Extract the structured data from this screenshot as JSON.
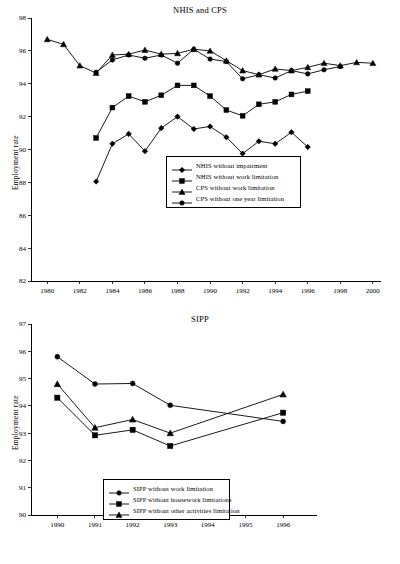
{
  "figure": {
    "panels": [
      {
        "id": "top",
        "title": "NHIS and CPS",
        "ylabel": "Employment rate",
        "legend": [
          {
            "label": "NHIS without impairment",
            "marker": "diamond"
          },
          {
            "label": "NHIS without work limitation",
            "marker": "square"
          },
          {
            "label": "CPS without work limitation",
            "marker": "triangle"
          },
          {
            "label": "CPS without one year limitation",
            "marker": "circle"
          }
        ]
      },
      {
        "id": "bottom",
        "title": "SIPP",
        "ylabel": "Employment rate",
        "legend": [
          {
            "label": "SIPP without work limitation",
            "marker": "circle"
          },
          {
            "label": "SIPP without housework limitations",
            "marker": "square"
          },
          {
            "label": "SIPP without other activities limitation",
            "marker": "triangle"
          }
        ]
      }
    ]
  },
  "chart_data": [
    {
      "type": "line",
      "title": "NHIS and CPS",
      "xlabel": "",
      "ylabel": "Employment rate",
      "xlim": [
        1979,
        2000.5
      ],
      "ylim": [
        82,
        98
      ],
      "xticks": [
        1980,
        1982,
        1984,
        1986,
        1988,
        1990,
        1992,
        1994,
        1996,
        1998,
        2000
      ],
      "yticks": [
        82,
        84,
        86,
        88,
        90,
        92,
        94,
        96,
        98
      ],
      "grid": false,
      "legend_position": "center",
      "series": [
        {
          "name": "NHIS without impairment",
          "marker": "diamond",
          "x": [
            1983,
            1984,
            1985,
            1986,
            1987,
            1988,
            1989,
            1990,
            1991,
            1992,
            1993,
            1994,
            1995,
            1996
          ],
          "values": [
            88.05,
            90.35,
            90.95,
            89.9,
            91.3,
            92.0,
            91.25,
            91.4,
            90.75,
            89.75,
            90.5,
            90.35,
            91.05,
            90.15
          ]
        },
        {
          "name": "NHIS without work limitation",
          "marker": "square",
          "x": [
            1983,
            1984,
            1985,
            1986,
            1987,
            1988,
            1989,
            1990,
            1991,
            1992,
            1993,
            1994,
            1995,
            1996
          ],
          "values": [
            90.7,
            92.55,
            93.25,
            92.9,
            93.3,
            93.9,
            93.9,
            93.25,
            92.4,
            92.05,
            92.75,
            92.9,
            93.35,
            93.55
          ]
        },
        {
          "name": "CPS without work limitation",
          "marker": "triangle",
          "x": [
            1980,
            1981,
            1982,
            1983,
            1984,
            1985,
            1986,
            1987,
            1988,
            1989,
            1990,
            1991,
            1992,
            1993,
            1994,
            1995,
            1996,
            1997,
            1998,
            1999,
            2000
          ],
          "values": [
            96.7,
            96.4,
            95.1,
            94.65,
            95.75,
            95.8,
            96.05,
            95.8,
            95.85,
            96.1,
            96.0,
            95.4,
            94.8,
            94.55,
            94.9,
            94.8,
            95.0,
            95.25,
            95.1,
            95.3,
            95.25
          ]
        },
        {
          "name": "CPS without one year limitation",
          "marker": "circle",
          "x": [
            1983,
            1984,
            1985,
            1986,
            1987,
            1988,
            1989,
            1990,
            1991,
            1992,
            1993,
            1994,
            1995,
            1996,
            1997,
            1998
          ],
          "values": [
            94.7,
            95.45,
            95.75,
            95.55,
            95.75,
            95.25,
            96.1,
            95.5,
            95.35,
            94.3,
            94.55,
            94.35,
            94.8,
            94.6,
            94.85,
            95.05
          ]
        }
      ]
    },
    {
      "type": "line",
      "title": "SIPP",
      "xlabel": "",
      "ylabel": "Employment rate",
      "xlim": [
        1989.3,
        1996.9
      ],
      "ylim": [
        90,
        97
      ],
      "xticks": [
        1990,
        1991,
        1992,
        1993,
        1994,
        1995,
        1996
      ],
      "yticks": [
        90,
        91,
        92,
        93,
        94,
        95,
        96,
        97
      ],
      "grid": false,
      "legend_position": "lower-center",
      "series": [
        {
          "name": "SIPP without work limitation",
          "marker": "circle",
          "x": [
            1990,
            1991,
            1992,
            1993,
            1996
          ],
          "values": [
            95.8,
            94.8,
            94.82,
            94.02,
            93.43
          ]
        },
        {
          "name": "SIPP without housework limitations",
          "marker": "square",
          "x": [
            1990,
            1991,
            1992,
            1993,
            1996
          ],
          "values": [
            94.3,
            92.92,
            93.12,
            92.53,
            93.75
          ]
        },
        {
          "name": "SIPP without other activities limitation",
          "marker": "triangle",
          "x": [
            1990,
            1991,
            1992,
            1993,
            1996
          ],
          "values": [
            94.8,
            93.2,
            93.5,
            93.0,
            94.42
          ]
        }
      ]
    }
  ]
}
